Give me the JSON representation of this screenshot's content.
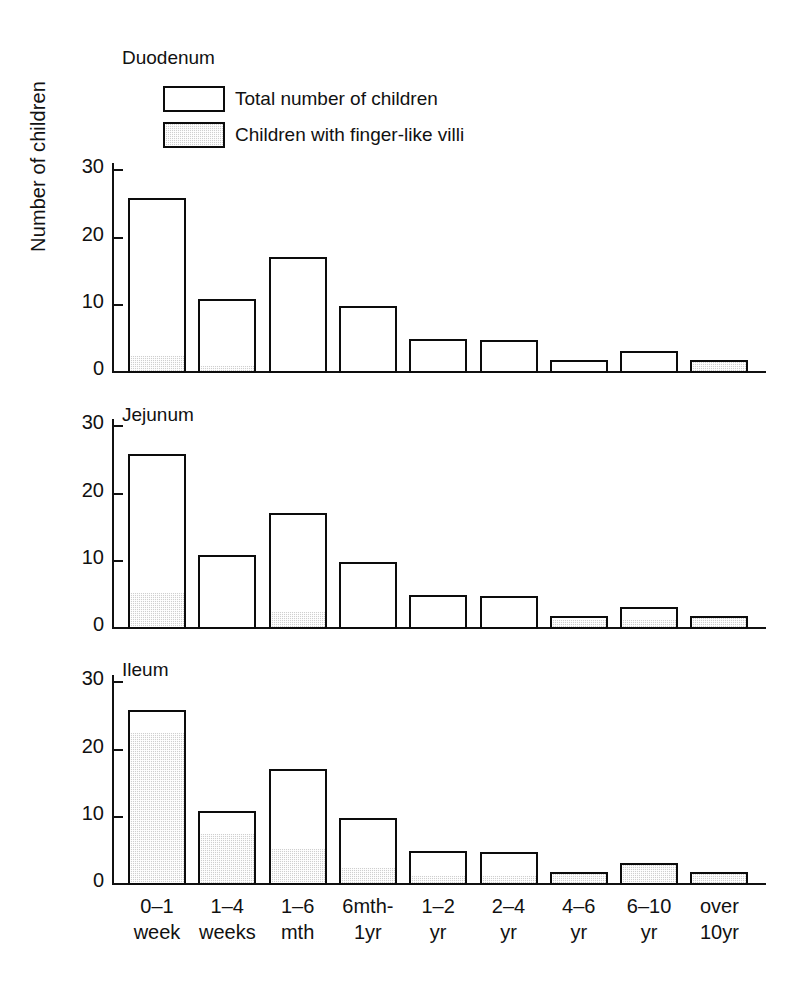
{
  "chart_data": {
    "type": "bar",
    "title": "",
    "xlabel": "",
    "ylabel": "Number of children",
    "ylim": [
      0,
      33
    ],
    "yticks": [
      0,
      10,
      20,
      30
    ],
    "ytick_labels": [
      "0",
      "10",
      "20",
      "30"
    ],
    "grid": false,
    "legend_position": "top-left inside first panel",
    "legend": [
      {
        "key": "total",
        "label": "Total number of children",
        "style": "open-outline"
      },
      {
        "key": "fingerlike",
        "label": "Children with finger-like villi",
        "style": "stippled-grey"
      }
    ],
    "categories": [
      "0–1\nweek",
      "1–4\nweeks",
      "1–6\nmth",
      "6mth-\n1yr",
      "1–2\nyr",
      "2–4\nyr",
      "4–6\nyr",
      "6–10\nyr",
      "over\n10yr"
    ],
    "totals": [
      26,
      11,
      17.3,
      10,
      5,
      4.9,
      2,
      3.3,
      2
    ],
    "panels": [
      {
        "title": "Duodenum",
        "values_total": [
          26,
          11,
          17.3,
          10,
          5,
          4.9,
          2,
          3.3,
          2
        ],
        "values_fingerlike": [
          2.2,
          0.8,
          0,
          0,
          0,
          0,
          0,
          0,
          1.7
        ]
      },
      {
        "title": "Jejunum",
        "values_total": [
          26,
          11,
          17.3,
          10,
          5,
          4.9,
          2,
          3.3,
          2
        ],
        "values_fingerlike": [
          5,
          0,
          2.3,
          0,
          0,
          0,
          1.1,
          1.1,
          2
        ]
      },
      {
        "title": "Ileum",
        "values_total": [
          26,
          11,
          17.3,
          10,
          5,
          4.9,
          2,
          3.3,
          2
        ],
        "values_fingerlike": [
          22.3,
          7.3,
          5,
          2.3,
          1.1,
          1.1,
          2,
          3.3,
          1.7
        ]
      }
    ],
    "colors": {
      "ink": "#0c0c0c",
      "fill_grey": "#cfcfcf",
      "background": "#ffffff"
    }
  }
}
